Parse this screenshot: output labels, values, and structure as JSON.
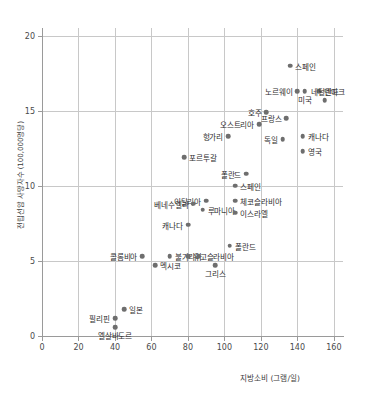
{
  "chart_data": {
    "type": "scatter",
    "title": "",
    "xlabel": "지방소비 (그램/일)",
    "ylabel": "전립선암 사망자수 (100,000명당)",
    "xlim": [
      0,
      165
    ],
    "ylim": [
      0,
      20.5
    ],
    "xticks": [
      0,
      20,
      40,
      60,
      80,
      100,
      120,
      140,
      160
    ],
    "yticks": [
      0,
      5,
      10,
      15,
      20
    ],
    "xtick_labels": [
      "0",
      "20",
      "40",
      "60",
      "80",
      "100",
      "120",
      "140",
      "160"
    ],
    "ytick_labels": [
      "0",
      "5",
      "10",
      "15",
      "20"
    ],
    "grid": true,
    "legend": "none",
    "marker_color": "#6e6e6e",
    "grid_color": "#c8c8c8",
    "axis_color": "#9a9a9a",
    "points": [
      {
        "label": "스페인",
        "x": 136,
        "y": 18.0,
        "lab_pos": "right"
      },
      {
        "label": "노르웨이",
        "x": 140,
        "y": 16.3,
        "lab_pos": "left"
      },
      {
        "label": "미국",
        "x": 144,
        "y": 16.3,
        "lab_pos": "below"
      },
      {
        "label": "덴마크",
        "x": 152,
        "y": 16.3,
        "lab_pos": "right"
      },
      {
        "label": "네덜란드",
        "x": 155,
        "y": 15.7,
        "lab_pos": "above"
      },
      {
        "label": "호주",
        "x": 123,
        "y": 14.9,
        "lab_pos": "left"
      },
      {
        "label": "프랑스",
        "x": 134,
        "y": 14.5,
        "lab_pos": "left"
      },
      {
        "label": "오스트리아",
        "x": 119,
        "y": 14.1,
        "lab_pos": "left"
      },
      {
        "label": "헝가리",
        "x": 102,
        "y": 13.3,
        "lab_pos": "left"
      },
      {
        "label": "캐나다",
        "x": 143,
        "y": 13.3,
        "lab_pos": "right"
      },
      {
        "label": "독일",
        "x": 132,
        "y": 13.1,
        "lab_pos": "left"
      },
      {
        "label": "영국",
        "x": 143,
        "y": 12.3,
        "lab_pos": "right"
      },
      {
        "label": "포르투갈",
        "x": 78,
        "y": 11.9,
        "lab_pos": "right"
      },
      {
        "label": "폴란드",
        "x": 112,
        "y": 10.8,
        "lab_pos": "left"
      },
      {
        "label": "스페인",
        "x": 106,
        "y": 10.0,
        "lab_pos": "right"
      },
      {
        "label": "이탈리아",
        "x": 90,
        "y": 9.0,
        "lab_pos": "left"
      },
      {
        "label": "체코슬라비아",
        "x": 106,
        "y": 9.0,
        "lab_pos": "right"
      },
      {
        "label": "베네수엘라",
        "x": 83,
        "y": 8.8,
        "lab_pos": "left"
      },
      {
        "label": "루마니아",
        "x": 88,
        "y": 8.4,
        "lab_pos": "right"
      },
      {
        "label": "이스라엘",
        "x": 106,
        "y": 8.2,
        "lab_pos": "right"
      },
      {
        "label": "캐나다",
        "x": 80,
        "y": 7.4,
        "lab_pos": "left"
      },
      {
        "label": "폴란드",
        "x": 103,
        "y": 6.0,
        "lab_pos": "right"
      },
      {
        "label": "콜롬비아",
        "x": 55,
        "y": 5.3,
        "lab_pos": "left"
      },
      {
        "label": "불가리아",
        "x": 70,
        "y": 5.3,
        "lab_pos": "right"
      },
      {
        "label": "유고슬라비아",
        "x": 80,
        "y": 5.3,
        "lab_pos": "right"
      },
      {
        "label": "",
        "x": 86,
        "y": 5.3,
        "lab_pos": "right"
      },
      {
        "label": "멕시코",
        "x": 62,
        "y": 4.7,
        "lab_pos": "right"
      },
      {
        "label": "그리스",
        "x": 95,
        "y": 4.7,
        "lab_pos": "below"
      },
      {
        "label": "일본",
        "x": 45,
        "y": 1.8,
        "lab_pos": "right"
      },
      {
        "label": "필리핀",
        "x": 40,
        "y": 1.2,
        "lab_pos": "left"
      },
      {
        "label": "엘살바도르",
        "x": 40,
        "y": 0.6,
        "lab_pos": "below"
      }
    ]
  }
}
